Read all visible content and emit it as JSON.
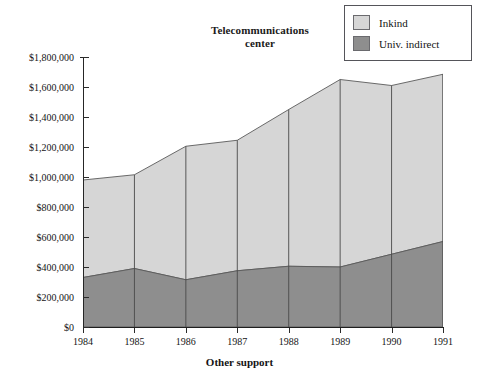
{
  "chart_data": {
    "type": "area",
    "title": "Telecommunications center",
    "title_lines": [
      "Telecommunications",
      "center"
    ],
    "xlabel": "Other support",
    "ylabel": "",
    "stacked": true,
    "grid": false,
    "legend_position": "top-right",
    "categories": [
      "1984",
      "1985",
      "1986",
      "1987",
      "1988",
      "1989",
      "1990",
      "1991"
    ],
    "x": [
      1984,
      1985,
      1986,
      1987,
      1988,
      1989,
      1990,
      1991
    ],
    "ylim": [
      0,
      1800000
    ],
    "ytick_values": [
      0,
      200000,
      400000,
      600000,
      800000,
      1000000,
      1200000,
      1400000,
      1600000,
      1800000
    ],
    "ytick_labels": [
      "$0",
      "$200,000",
      "$400,000",
      "$600,000",
      "$800,000",
      "$1,000,000",
      "$1,200,000",
      "$1,400,000",
      "$1,600,000",
      "$1,800,000"
    ],
    "series": [
      {
        "name": "Univ. indirect",
        "color": "#8e8e8e",
        "values": [
          330000,
          390000,
          315000,
          375000,
          405000,
          400000,
          485000,
          570000
        ]
      },
      {
        "name": "Inkind",
        "color": "#d6d6d6",
        "values": [
          650000,
          625000,
          890000,
          870000,
          1045000,
          1250000,
          1125000,
          1115000
        ]
      }
    ],
    "totals": [
      980000,
      1015000,
      1205000,
      1245000,
      1450000,
      1650000,
      1610000,
      1685000
    ],
    "annotations": []
  },
  "legend": {
    "items": [
      {
        "label": "Inkind",
        "color": "#d6d6d6"
      },
      {
        "label": "Univ. indirect",
        "color": "#8e8e8e"
      }
    ]
  }
}
